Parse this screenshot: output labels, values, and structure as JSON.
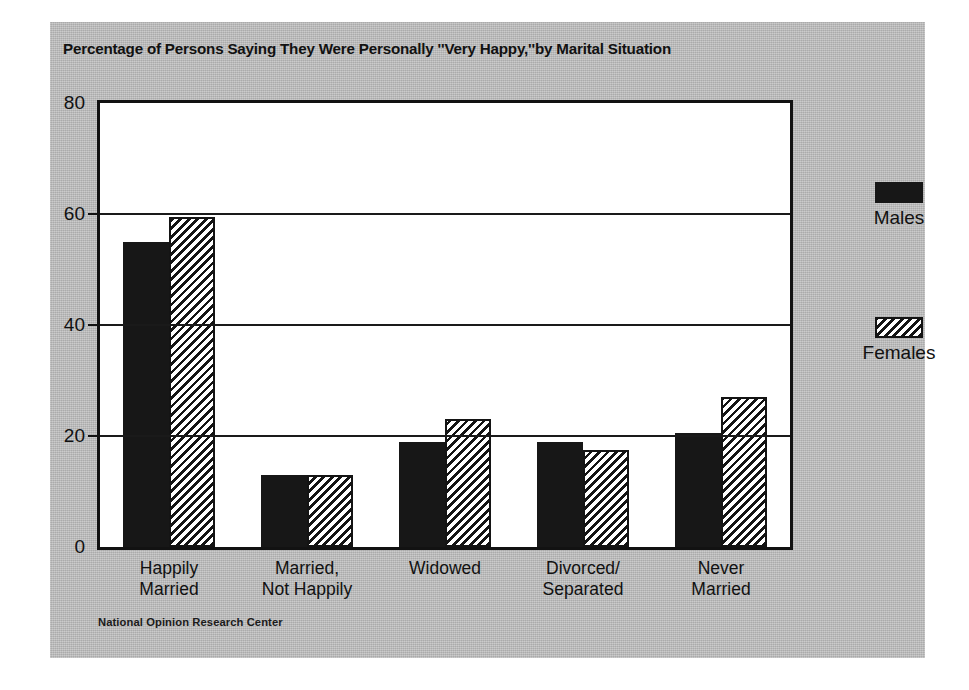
{
  "chart_data": {
    "type": "bar",
    "title": "Percentage of Persons Saying They Were Personally ''Very Happy,''by Marital Situation",
    "xlabel": "",
    "ylabel": "",
    "ylim": [
      0,
      80
    ],
    "yticks": [
      0,
      20,
      40,
      60,
      80
    ],
    "grid": true,
    "legend_position": "right",
    "categories": [
      "Happily\nMarried",
      "Married,\nNot Happily",
      "Widowed",
      "Divorced/\nSeparated",
      "Never\nMarried"
    ],
    "category_lines": [
      [
        "Happily",
        "Married"
      ],
      [
        "Married,",
        "Not Happily"
      ],
      [
        "Widowed",
        ""
      ],
      [
        "Divorced/",
        "Separated"
      ],
      [
        "Never",
        "Married"
      ]
    ],
    "series": [
      {
        "name": "Males",
        "pattern": "solid-black",
        "values": [
          55,
          13,
          19,
          19,
          20.5
        ]
      },
      {
        "name": "Females",
        "pattern": "diagonal-hatch",
        "values": [
          59.5,
          13,
          23,
          17.5,
          27
        ]
      }
    ],
    "source": "National Opinion Research Center"
  },
  "legend": {
    "items": [
      {
        "label": "Males",
        "swatch": "solid-black-swatch"
      },
      {
        "label": "Females",
        "swatch": "diagonal-hatch-swatch"
      }
    ]
  },
  "axis": {
    "y_tick_labels": [
      "80",
      "60",
      "40",
      "20",
      "0"
    ]
  },
  "colors": {
    "panel_background": "#bcbcbc",
    "page_background": "#ffffff",
    "plot_background": "#ffffff",
    "ink": "#121212",
    "bar_males": "#171717",
    "bar_females_hatch": "#141414"
  }
}
